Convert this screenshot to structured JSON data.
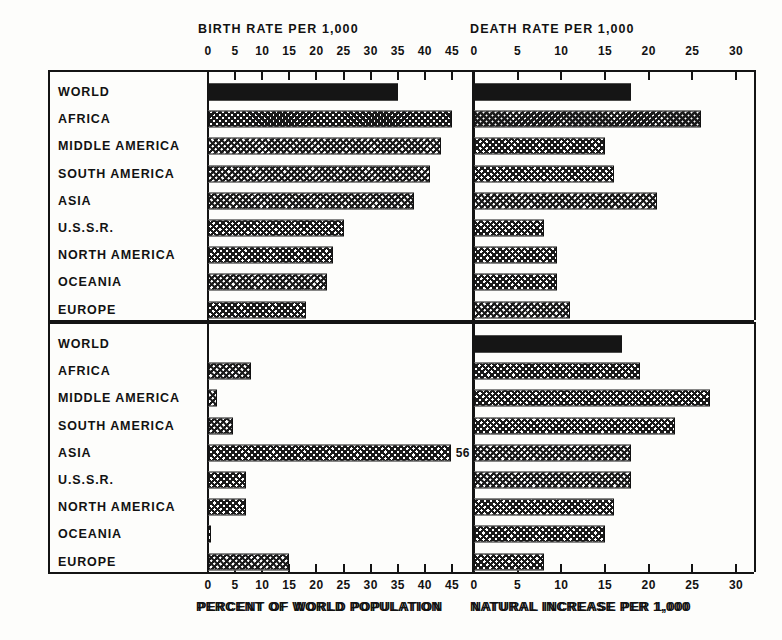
{
  "chart_data": {
    "type": "bar",
    "title": "",
    "orientation": "horizontal",
    "grid": false,
    "legend": null,
    "categories": [
      "WORLD",
      "AFRICA",
      "MIDDLE AMERICA",
      "SOUTH AMERICA",
      "ASIA",
      "U.S.S.R.",
      "NORTH AMERICA",
      "OCEANIA",
      "EUROPE"
    ],
    "panels": [
      {
        "id": "birth-rate",
        "position": "top-left",
        "title": "BIRTH RATE PER 1,000",
        "title_position": "top",
        "xlabel": "",
        "xlim": [
          0,
          45
        ],
        "xticks": [
          "0",
          "5",
          "10",
          "15",
          "20",
          "25",
          "30",
          "35",
          "40",
          "45"
        ],
        "xtick_values": [
          0,
          5,
          10,
          15,
          20,
          25,
          30,
          35,
          40,
          45
        ],
        "values": [
          35,
          45,
          43,
          41,
          38,
          25,
          23,
          22,
          18
        ],
        "styles": [
          "solid",
          "hatch",
          "hatch",
          "hatch",
          "hatch",
          "hatch",
          "hatch",
          "hatch",
          "hatch"
        ],
        "value_labels": [
          "",
          "",
          "",
          "",
          "",
          "",
          "",
          "",
          ""
        ]
      },
      {
        "id": "death-rate",
        "position": "top-right",
        "title": "DEATH RATE PER 1,000",
        "title_position": "top",
        "xlabel": "",
        "xlim": [
          0,
          30
        ],
        "xticks": [
          "0",
          "5",
          "10",
          "15",
          "20",
          "25",
          "30"
        ],
        "xtick_values": [
          0,
          5,
          10,
          15,
          20,
          25,
          30
        ],
        "values": [
          18,
          26,
          15,
          16,
          21,
          8,
          9.5,
          9.5,
          11
        ],
        "styles": [
          "solid",
          "hatch",
          "hatch",
          "hatch",
          "hatch",
          "hatch",
          "hatch",
          "hatch",
          "hatch"
        ],
        "value_labels": [
          "",
          "",
          "",
          "",
          "",
          "",
          "",
          "",
          ""
        ]
      },
      {
        "id": "percent-world-population",
        "position": "bottom-left",
        "title": "PERCENT OF WORLD POPULATION",
        "title_position": "bottom",
        "xlabel": "PERCENT OF WORLD POPULATION",
        "xlim": [
          0,
          45
        ],
        "xticks": [
          "0",
          "5",
          "10",
          "15",
          "20",
          "25",
          "30",
          "35",
          "40",
          "45"
        ],
        "xtick_values": [
          0,
          5,
          10,
          15,
          20,
          25,
          30,
          35,
          40,
          45
        ],
        "values": [
          0,
          8,
          1.7,
          4.7,
          56,
          7,
          7,
          0.5,
          15
        ],
        "styles": [
          "none",
          "hatch",
          "hatch",
          "hatch",
          "hatch",
          "hatch",
          "hatch",
          "hatch",
          "hatch"
        ],
        "value_labels": [
          "",
          "",
          "",
          "",
          "56",
          "",
          "",
          "",
          ""
        ],
        "clipped": [
          false,
          false,
          false,
          false,
          true,
          false,
          false,
          false,
          false
        ]
      },
      {
        "id": "natural-increase",
        "position": "bottom-right",
        "title": "NATURAL INCREASE PER 1,000",
        "title_position": "bottom",
        "xlabel": "NATURAL INCREASE PER 1,000",
        "xlim": [
          0,
          30
        ],
        "xticks": [
          "0",
          "5",
          "10",
          "15",
          "20",
          "25",
          "30"
        ],
        "xtick_values": [
          0,
          5,
          10,
          15,
          20,
          25,
          30
        ],
        "values": [
          17,
          19,
          27,
          23,
          18,
          18,
          16,
          15,
          8
        ],
        "styles": [
          "solid",
          "hatch",
          "hatch",
          "hatch",
          "hatch",
          "hatch",
          "hatch",
          "hatch",
          "hatch"
        ],
        "value_labels": [
          "",
          "",
          "",
          "",
          "",
          "",
          "",
          "",
          ""
        ]
      }
    ]
  }
}
